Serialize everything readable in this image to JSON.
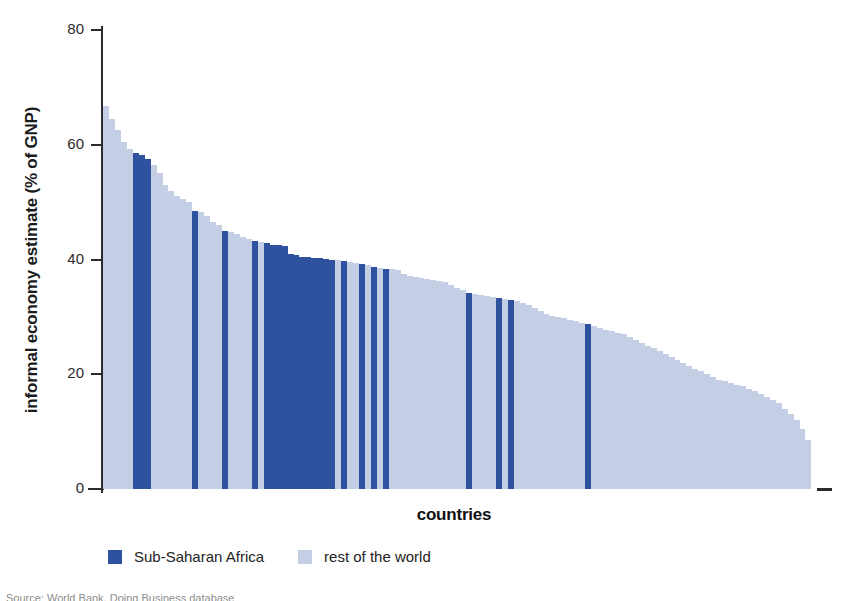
{
  "chart_data": {
    "type": "bar",
    "title": "",
    "xlabel": "countries",
    "ylabel": "informal economy estimate (% of GNP)",
    "ylim": [
      0,
      80
    ],
    "yticks": [
      0,
      20,
      40,
      60,
      80
    ],
    "grid": false,
    "legend_position": "bottom-left",
    "series": [
      {
        "name": "Sub-Saharan Africa",
        "color": "#2f52a0"
      },
      {
        "name": "rest of the world",
        "color": "#c4cee4"
      }
    ],
    "note": "Each bar is one country, sorted descending by informal economy estimate as % of GNP. group = 'ssa' (Sub-Saharan Africa) or 'row' (rest of the world).",
    "values": [
      66.8,
      64.5,
      62.5,
      60.5,
      59.3,
      58.6,
      58.3,
      57.5,
      56.5,
      55.0,
      53.0,
      52.0,
      51.0,
      50.5,
      50.0,
      48.5,
      48.2,
      47.5,
      46.5,
      46.0,
      45.0,
      44.8,
      44.5,
      44.0,
      43.5,
      43.2,
      43.0,
      42.8,
      42.6,
      42.5,
      42.3,
      41.0,
      40.8,
      40.5,
      40.4,
      40.3,
      40.2,
      40.1,
      40.0,
      39.9,
      39.8,
      39.5,
      39.4,
      39.3,
      39.0,
      38.7,
      38.5,
      38.4,
      38.3,
      38.2,
      37.5,
      37.2,
      37.0,
      36.8,
      36.6,
      36.4,
      36.2,
      36.0,
      35.5,
      35.0,
      34.6,
      34.2,
      34.0,
      33.8,
      33.6,
      33.4,
      33.3,
      33.2,
      33.0,
      32.8,
      32.5,
      32.0,
      31.5,
      31.0,
      30.5,
      30.2,
      30.0,
      29.8,
      29.5,
      29.2,
      29.0,
      28.7,
      28.4,
      28.0,
      27.8,
      27.5,
      27.2,
      27.0,
      26.5,
      26.0,
      25.5,
      25.0,
      24.5,
      24.0,
      23.5,
      23.0,
      22.5,
      22.0,
      21.5,
      21.0,
      20.5,
      20.0,
      19.5,
      19.0,
      18.8,
      18.5,
      18.2,
      18.0,
      17.5,
      17.0,
      16.5,
      16.0,
      15.5,
      15.0,
      14.0,
      13.0,
      12.0,
      10.5,
      8.5
    ],
    "groups": [
      "row",
      "row",
      "row",
      "row",
      "row",
      "ssa",
      "ssa",
      "ssa",
      "row",
      "row",
      "row",
      "row",
      "row",
      "row",
      "row",
      "ssa",
      "row",
      "row",
      "row",
      "row",
      "ssa",
      "row",
      "row",
      "row",
      "row",
      "ssa",
      "row",
      "ssa",
      "ssa",
      "ssa",
      "ssa",
      "ssa",
      "ssa",
      "ssa",
      "ssa",
      "ssa",
      "ssa",
      "ssa",
      "ssa",
      "row",
      "ssa",
      "row",
      "row",
      "ssa",
      "row",
      "ssa",
      "row",
      "ssa",
      "row",
      "row",
      "row",
      "row",
      "row",
      "row",
      "row",
      "row",
      "row",
      "row",
      "row",
      "row",
      "row",
      "ssa",
      "row",
      "row",
      "row",
      "row",
      "ssa",
      "row",
      "ssa",
      "row",
      "row",
      "row",
      "row",
      "row",
      "row",
      "row",
      "row",
      "row",
      "row",
      "row",
      "row",
      "ssa",
      "row",
      "row",
      "row",
      "row",
      "row",
      "row",
      "row",
      "row",
      "row",
      "row",
      "row",
      "row",
      "row",
      "row",
      "row",
      "row",
      "row",
      "row",
      "row",
      "row",
      "row",
      "row",
      "row",
      "row",
      "row",
      "row",
      "row",
      "row",
      "row",
      "row",
      "row",
      "row",
      "row",
      "row",
      "row",
      "row",
      "row"
    ]
  },
  "axis": {
    "y_label": "informal economy estimate (% of GNP)",
    "x_label": "countries",
    "tick_labels": [
      "80",
      "60",
      "40",
      "20",
      "0"
    ]
  },
  "legend": {
    "items": [
      {
        "label": "Sub-Saharan Africa",
        "key": "ssa"
      },
      {
        "label": "rest of the world",
        "key": "row"
      }
    ]
  },
  "source": {
    "text": "Source: World Bank, Doing Business database"
  }
}
